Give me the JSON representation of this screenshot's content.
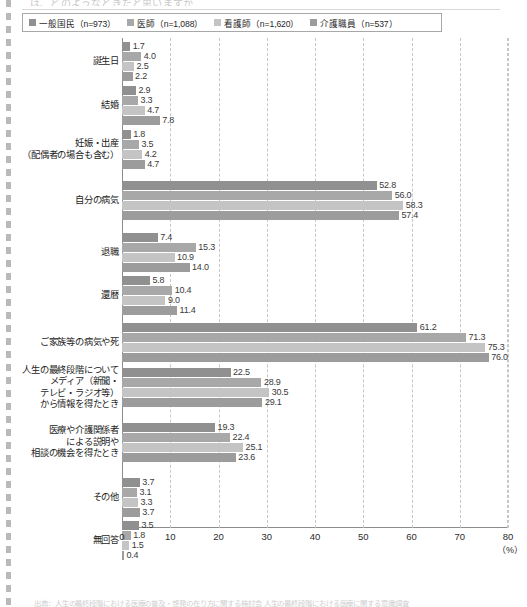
{
  "page": {
    "top_cut_text": "は、どのようなときだと思いますか",
    "footnote": "出典：人生の最終段階における医療の普及・啓発の在り方に関する検討会 人生の最終段階における医療に関する意識調査"
  },
  "legend": {
    "items": [
      {
        "label": "一般国民（n=973）",
        "color": "#909090"
      },
      {
        "label": "医師（n=1,088）",
        "color": "#a8a8a8"
      },
      {
        "label": "看護師（n=1,620）",
        "color": "#c4c4c4"
      },
      {
        "label": "介護職員（n=537）",
        "color": "#9c9c9c"
      }
    ]
  },
  "axis": {
    "x_ticks": [
      "0",
      "10",
      "20",
      "30",
      "40",
      "50",
      "60",
      "70",
      "80"
    ],
    "unit": "（%）"
  },
  "chart_data": {
    "type": "bar",
    "orientation": "horizontal",
    "title": "",
    "subtitle": "",
    "xlabel": "（%）",
    "ylabel": "",
    "xlim": [
      0,
      80
    ],
    "xtick_step": 10,
    "grid": true,
    "legend_position": "top",
    "categories": [
      "誕生日",
      "結婚",
      "妊娠・出産\n（配偶者の場合も含む）",
      "自分の病気",
      "退職",
      "還暦",
      "ご家族等の病気や死",
      "人生の最終段階について\nメディア（新聞・\nテレビ・ラジオ等）\nから情報を得たとき",
      "医療や介護関係者\nによる説明や\n相談の機会を得たとき",
      "その他",
      "無回答"
    ],
    "series": [
      {
        "name": "一般国民（n=973）",
        "color": "#909090",
        "values": [
          1.7,
          2.9,
          1.8,
          52.8,
          7.4,
          5.8,
          61.2,
          22.5,
          19.3,
          3.7,
          3.5
        ]
      },
      {
        "name": "医師（n=1,088）",
        "color": "#a8a8a8",
        "values": [
          4.0,
          3.3,
          3.5,
          56.0,
          15.3,
          10.4,
          71.3,
          28.9,
          22.4,
          3.1,
          1.8
        ]
      },
      {
        "name": "看護師（n=1,620）",
        "color": "#c4c4c4",
        "values": [
          2.5,
          4.7,
          4.2,
          58.3,
          10.9,
          9.0,
          75.3,
          30.5,
          25.1,
          3.3,
          1.5
        ]
      },
      {
        "name": "介護職員（n=537）",
        "color": "#9c9c9c",
        "values": [
          2.2,
          7.8,
          4.7,
          57.4,
          14.0,
          11.4,
          76.0,
          29.1,
          23.6,
          3.7,
          0.4
        ]
      }
    ]
  }
}
